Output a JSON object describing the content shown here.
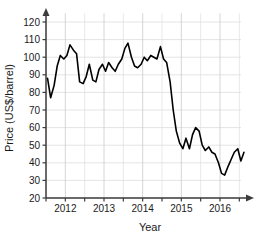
{
  "chart_data": {
    "type": "line",
    "title": "",
    "xlabel": "Year",
    "ylabel": "Price (US$/barrel)",
    "xlim": [
      2011.5,
      2016.75
    ],
    "ylim": [
      20,
      125
    ],
    "ytick_labels": [
      "20",
      "30",
      "40",
      "50",
      "60",
      "70",
      "80",
      "90",
      "100",
      "110",
      "120"
    ],
    "ytick_values": [
      20,
      30,
      40,
      50,
      60,
      70,
      80,
      90,
      100,
      110,
      120
    ],
    "xtick_labels": [
      "2012",
      "2013",
      "2014",
      "2015",
      "2016"
    ],
    "xtick_values": [
      2012,
      2013,
      2014,
      2015,
      2016
    ],
    "minor_xticks": [
      2011.5,
      2012.5,
      2013.5,
      2014.5,
      2015.5,
      2016.5
    ],
    "grid": true,
    "grid_color": "#d8d8d8",
    "line_color": "#000000",
    "axis_color": "#3c3c3c",
    "background": "#ffffff",
    "legend": "none",
    "series": [
      {
        "name": "Crude oil price",
        "x": [
          2011.54,
          2011.62,
          2011.71,
          2011.79,
          2011.87,
          2011.96,
          2012.04,
          2012.12,
          2012.21,
          2012.29,
          2012.37,
          2012.46,
          2012.54,
          2012.62,
          2012.71,
          2012.79,
          2012.87,
          2012.96,
          2013.04,
          2013.12,
          2013.21,
          2013.29,
          2013.37,
          2013.46,
          2013.54,
          2013.62,
          2013.71,
          2013.79,
          2013.87,
          2013.96,
          2014.04,
          2014.12,
          2014.21,
          2014.29,
          2014.37,
          2014.46,
          2014.54,
          2014.62,
          2014.71,
          2014.79,
          2014.87,
          2014.96,
          2015.04,
          2015.12,
          2015.21,
          2015.29,
          2015.37,
          2015.46,
          2015.54,
          2015.62,
          2015.71,
          2015.79,
          2015.87,
          2015.96,
          2016.04,
          2016.12,
          2016.21,
          2016.29,
          2016.37,
          2016.46,
          2016.54,
          2016.62
        ],
        "y": [
          88,
          77,
          84,
          95,
          101,
          99,
          101,
          107,
          104,
          102,
          86,
          85,
          89,
          96,
          87,
          86,
          93,
          96,
          92,
          97,
          94,
          92,
          96,
          99,
          105,
          108,
          100,
          95,
          94,
          96,
          100,
          98,
          101,
          100,
          99,
          106,
          99,
          97,
          86,
          70,
          58,
          51,
          48,
          54,
          48,
          56,
          60,
          58,
          50,
          47,
          49,
          46,
          45,
          40,
          34,
          33,
          38,
          42,
          46,
          48,
          41,
          46
        ]
      }
    ]
  },
  "axis": {
    "y_title": "Price (US$/barrel)",
    "x_title": "Year"
  }
}
